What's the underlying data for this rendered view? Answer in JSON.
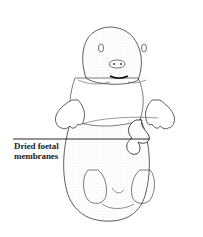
{
  "figure": {
    "annotations": [
      {
        "line1": "Dried foetal",
        "line2": "membranes"
      }
    ]
  }
}
